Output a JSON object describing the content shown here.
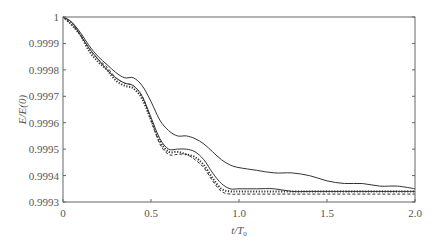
{
  "chart_data": {
    "type": "line",
    "title": "",
    "xlabel": "t/T0",
    "xlabel_main": "t/T",
    "xlabel_sub": "0",
    "ylabel": "E/E(0)",
    "xlim": [
      0,
      2.0
    ],
    "ylim": [
      0.9993,
      1.0
    ],
    "grid": false,
    "legend": null,
    "x_ticks": [
      0,
      0.5,
      1.0,
      1.5,
      2.0
    ],
    "x_tick_labels": [
      "0",
      "0.5",
      "1.0",
      "1.5",
      "2.0"
    ],
    "y_ticks": [
      0.9993,
      0.9994,
      0.9995,
      0.9996,
      0.9997,
      0.9998,
      0.9999,
      1.0
    ],
    "y_tick_labels": [
      "0.9993",
      "0.9994",
      "0.9995",
      "0.9996",
      "0.9997",
      "0.9998",
      "0.9999",
      "1"
    ],
    "series": [
      {
        "name": "solid-upper",
        "style": "solid",
        "x": [
          0,
          0.05,
          0.1,
          0.15,
          0.2,
          0.25,
          0.3,
          0.35,
          0.4,
          0.45,
          0.5,
          0.55,
          0.6,
          0.65,
          0.7,
          0.75,
          0.8,
          0.85,
          0.9,
          0.95,
          1.0,
          1.1,
          1.2,
          1.3,
          1.4,
          1.5,
          1.6,
          1.7,
          1.8,
          1.9,
          2.0
        ],
        "values": [
          1.0,
          0.99998,
          0.99994,
          0.99989,
          0.99985,
          0.99982,
          0.99979,
          0.99977,
          0.99977,
          0.99974,
          0.99968,
          0.99961,
          0.99957,
          0.99955,
          0.99955,
          0.99954,
          0.99952,
          0.99949,
          0.99946,
          0.99944,
          0.99943,
          0.99942,
          0.99941,
          0.99941,
          0.9994,
          0.99938,
          0.99937,
          0.99937,
          0.99936,
          0.99936,
          0.99935
        ]
      },
      {
        "name": "solid-lower",
        "style": "solid",
        "x": [
          0,
          0.05,
          0.1,
          0.15,
          0.2,
          0.25,
          0.3,
          0.35,
          0.4,
          0.45,
          0.5,
          0.55,
          0.6,
          0.65,
          0.7,
          0.75,
          0.8,
          0.85,
          0.9,
          0.95,
          1.0,
          1.1,
          1.2,
          1.3,
          1.4,
          1.5,
          1.6,
          1.7,
          1.8,
          1.9,
          2.0
        ],
        "values": [
          1.0,
          0.99998,
          0.99993,
          0.99988,
          0.99984,
          0.9998,
          0.99977,
          0.99975,
          0.99974,
          0.9997,
          0.99962,
          0.99954,
          0.9995,
          0.9995,
          0.9995,
          0.99949,
          0.99946,
          0.99941,
          0.99937,
          0.99935,
          0.99935,
          0.99935,
          0.99935,
          0.99934,
          0.99934,
          0.99934,
          0.99934,
          0.99934,
          0.99934,
          0.99934,
          0.99934
        ]
      },
      {
        "name": "dotted-markers",
        "style": "dotted",
        "x": [
          0,
          0.05,
          0.1,
          0.15,
          0.2,
          0.25,
          0.3,
          0.35,
          0.4,
          0.45,
          0.5,
          0.55,
          0.6,
          0.65,
          0.7,
          0.75,
          0.8,
          0.85,
          0.9,
          0.95,
          1.0,
          1.1,
          1.2,
          1.3,
          1.4,
          1.5,
          1.6,
          1.7,
          1.8,
          1.9,
          2.0
        ],
        "values": [
          1.0,
          0.99997,
          0.99993,
          0.99987,
          0.99983,
          0.9998,
          0.99976,
          0.99974,
          0.99973,
          0.99969,
          0.99961,
          0.99953,
          0.99949,
          0.99949,
          0.99948,
          0.99947,
          0.99944,
          0.99939,
          0.99935,
          0.99934,
          0.99934,
          0.99934,
          0.99934,
          0.99934,
          0.99934,
          0.99934,
          0.99934,
          0.99934,
          0.99934,
          0.99934,
          0.99934
        ]
      },
      {
        "name": "dashed",
        "style": "dashed",
        "x": [
          0,
          0.05,
          0.1,
          0.15,
          0.2,
          0.25,
          0.3,
          0.35,
          0.4,
          0.45,
          0.5,
          0.55,
          0.6,
          0.65,
          0.7,
          0.75,
          0.8,
          0.85,
          0.9,
          0.95,
          1.0,
          1.1,
          1.2,
          1.3,
          1.4,
          1.5,
          1.6,
          1.7,
          1.8,
          1.9,
          2.0
        ],
        "values": [
          1.0,
          0.99997,
          0.99993,
          0.99988,
          0.99984,
          0.99981,
          0.99977,
          0.99975,
          0.99974,
          0.9997,
          0.99961,
          0.99952,
          0.99948,
          0.99948,
          0.99948,
          0.99946,
          0.99943,
          0.99938,
          0.99934,
          0.99933,
          0.99933,
          0.99933,
          0.99933,
          0.99933,
          0.99933,
          0.99933,
          0.99933,
          0.99933,
          0.99933,
          0.99933,
          0.99933
        ]
      }
    ]
  },
  "layout": {
    "plot": {
      "left": 63,
      "right": 415,
      "top": 17,
      "bottom": 202
    },
    "colors": {
      "axis": "#666666",
      "line": "#333333",
      "text": "#555555"
    }
  }
}
